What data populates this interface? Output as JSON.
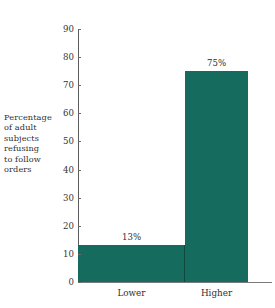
{
  "chart_data": {
    "type": "bar",
    "title": "",
    "subtitle": "",
    "xlabel": "",
    "ylabel": "Percentage of adult subjects refusing to follow orders",
    "ylabel_lines": [
      "Percentage",
      "of adult",
      "subjects",
      "refusing",
      "to follow",
      "orders"
    ],
    "categories": [
      "Lower",
      "Higher"
    ],
    "values": [
      13,
      75
    ],
    "value_labels": [
      "13%",
      "75%"
    ],
    "ylim": [
      0,
      90
    ],
    "yticks": [
      0,
      10,
      20,
      30,
      40,
      50,
      60,
      70,
      80,
      90
    ],
    "ytick_labels": [
      "0",
      "10",
      "20",
      "30",
      "40",
      "50",
      "60",
      "70",
      "80",
      "90"
    ],
    "grid": false,
    "legend": false,
    "legend_position": "none",
    "bar_color": "#156b5d",
    "axis_color": "#5b5b5b",
    "text_color": "#2f2f2f",
    "background_color": "#ffffff"
  }
}
